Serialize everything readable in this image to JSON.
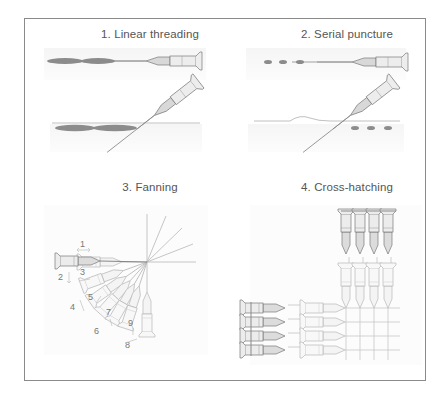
{
  "figure": {
    "panels": [
      {
        "id": 1,
        "title": "1. Linear threading",
        "technique": "linear-threading"
      },
      {
        "id": 2,
        "title": "2. Serial puncture",
        "technique": "serial-puncture"
      },
      {
        "id": 3,
        "title": "3. Fanning",
        "technique": "fanning",
        "step_labels": [
          "1",
          "2",
          "3",
          "4",
          "5",
          "6",
          "7",
          "8",
          "9"
        ]
      },
      {
        "id": 4,
        "title": "4. Cross-hatching",
        "technique": "cross-hatching"
      }
    ],
    "colors": {
      "frame": "#8a8a8a",
      "title_text": "#555555",
      "deposit": "#8c8c8c",
      "needle_dark": "#7a7a7a",
      "needle_light": "#c4c4c4",
      "skin_line": "#b0b0b0",
      "shadow": "#f2f2f2"
    }
  }
}
